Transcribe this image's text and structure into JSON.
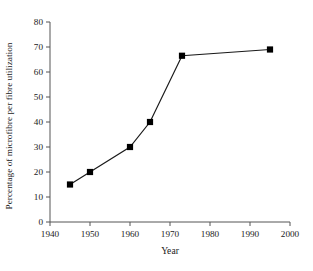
{
  "chart_data": {
    "type": "line",
    "title": "",
    "subtitle": "",
    "xlabel": "Year",
    "ylabel": "Percentage of microfibre per fibre utilization",
    "xlim": [
      1940,
      2000
    ],
    "ylim": [
      0,
      80
    ],
    "xticks": [
      1940,
      1950,
      1960,
      1970,
      1980,
      1990,
      2000
    ],
    "xtick_labels": [
      "1940",
      "1950",
      "1960",
      "1970",
      "1980",
      "1990",
      "2000"
    ],
    "yticks": [
      0,
      10,
      20,
      30,
      40,
      50,
      60,
      70,
      80
    ],
    "ytick_labels": [
      "0",
      "10",
      "20",
      "30",
      "40",
      "50",
      "60",
      "70",
      "80"
    ],
    "grid": false,
    "legend": null,
    "legend_position": "none",
    "marker": "filled-square",
    "marker_color": "#000000",
    "line_color": "#1a1a1a",
    "background_color": "#ffffff",
    "axis_style": "open-left-bottom",
    "series": [
      {
        "name": "microfibre utilization",
        "x": [
          1945,
          1950,
          1960,
          1965,
          1973,
          1995
        ],
        "values": [
          15,
          20,
          30,
          40,
          66.5,
          69
        ]
      }
    ]
  },
  "figure": {
    "caption_sliver": ""
  }
}
